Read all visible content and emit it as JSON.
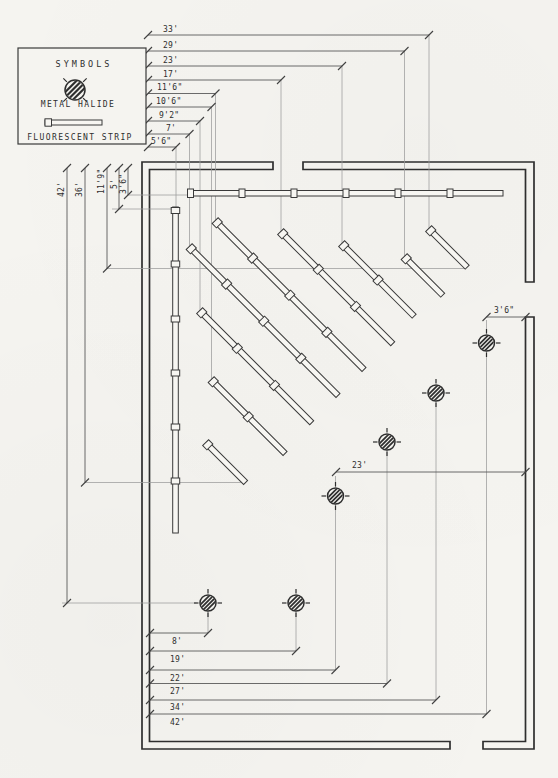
{
  "legend": {
    "title": "SYMBOLS",
    "items": [
      {
        "label": "METAL HALIDE"
      },
      {
        "label": "FLUORESCENT STRIP"
      }
    ]
  },
  "dimensions": {
    "top": [
      "33'",
      "29'",
      "23'",
      "17'",
      "11'6\"",
      "10'6\"",
      "9'2\"",
      "7'",
      "5'6\""
    ],
    "left": [
      "42'",
      "36'",
      "11'9\"",
      "5'",
      "3'6\""
    ],
    "bottom": [
      "8'",
      "19'",
      "22'",
      "27'",
      "34'",
      "42'"
    ],
    "interior": [
      "3'6\"",
      "23'"
    ]
  },
  "colors": {
    "paper": "#f5f4f0",
    "ink": "#2e2e2e",
    "dim_line": "#5a5a5a",
    "extension_line": "#9b9b9b"
  }
}
